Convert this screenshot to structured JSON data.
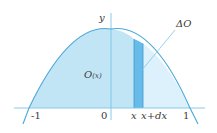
{
  "diagram": {
    "title": "",
    "colors": {
      "curve": "#4aa8d8",
      "axis": "#7cc4e8",
      "fill_left": "#c2e5f6",
      "fill_right": "#dcf1fb",
      "strip": "#66bbe8",
      "strip_edge": "#3d9ad0",
      "leader": "#7cc4e8",
      "text": "#3a3a3a"
    },
    "axes": {
      "y_label": "y",
      "x_ticks": [
        {
          "label": "-1",
          "value": -1
        },
        {
          "label": "0",
          "value": 0
        },
        {
          "label": "1",
          "value": 1
        }
      ]
    },
    "curve": {
      "description": "downward parabola with vertex on y-axis, crossing x-axis at -1 and 1"
    },
    "region_label": {
      "main": "O",
      "arg": "(x)"
    },
    "strip": {
      "left_label": "x",
      "right_label": "x+dx"
    },
    "callout": {
      "label": "ΔO"
    }
  }
}
